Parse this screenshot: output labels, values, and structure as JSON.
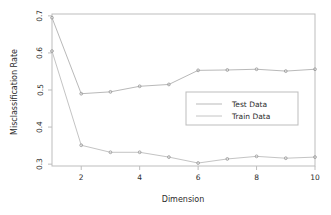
{
  "chart_data": {
    "type": "line",
    "title": "",
    "xlabel": "Dimension",
    "ylabel": "Misclassification Rate",
    "x": [
      1,
      2,
      3,
      4,
      5,
      6,
      7,
      8,
      9,
      10
    ],
    "xlim": [
      1,
      10
    ],
    "ylim": [
      0.295,
      0.705
    ],
    "xticks": [
      2,
      4,
      6,
      8,
      10
    ],
    "xtick_labels": [
      "2",
      "4",
      "6",
      "8",
      "10"
    ],
    "yticks": [
      0.3,
      0.4,
      0.5,
      0.6,
      0.7
    ],
    "ytick_labels": [
      "0.3",
      "0.4",
      "0.5",
      "0.6",
      "0.7"
    ],
    "grid": false,
    "legend_position": "center-right",
    "marker": "point",
    "series": [
      {
        "name": "Test Data",
        "color": "#b9b9b9",
        "values": [
          0.695,
          0.49,
          0.495,
          0.51,
          0.515,
          0.553,
          0.554,
          0.556,
          0.551,
          0.556
        ]
      },
      {
        "name": "Train Data",
        "color": "#c4c4c4",
        "values": [
          0.605,
          0.351,
          0.332,
          0.332,
          0.319,
          0.303,
          0.314,
          0.321,
          0.316,
          0.319
        ]
      }
    ]
  },
  "legend": {
    "entries": [
      {
        "label": "Test Data"
      },
      {
        "label": "Train Data"
      }
    ]
  },
  "style": {
    "frame_color": "#bdbdbd",
    "text_color": "#2b2b2b",
    "background": "#ffffff"
  }
}
